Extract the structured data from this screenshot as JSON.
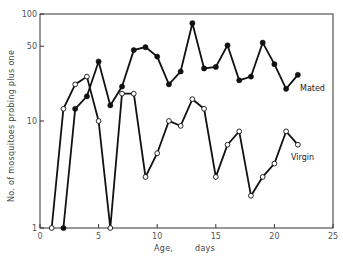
{
  "chart_data": {
    "type": "line",
    "title": "",
    "xlabel": "Age,        days",
    "ylabel": "No. of mosquitoes probing plus one",
    "xlim": [
      0,
      25
    ],
    "ylim": [
      1,
      100
    ],
    "yscale": "log",
    "xticks": [
      0,
      5,
      10,
      15,
      20,
      25
    ],
    "yticks": [
      1,
      10,
      50,
      100
    ],
    "ytick_labels": [
      "1",
      "10",
      "50",
      "100"
    ],
    "grid": false,
    "legend": "inline labels at line ends",
    "series": [
      {
        "name": "Mated",
        "marker": "filled-circle",
        "x": [
          2,
          3,
          4,
          5,
          6,
          7,
          8,
          9,
          10,
          11,
          12,
          13,
          14,
          15,
          16,
          17,
          18,
          19,
          20,
          21,
          22
        ],
        "values": [
          1,
          13,
          17,
          36,
          14,
          21,
          46,
          49,
          40,
          22,
          29,
          82,
          31,
          32,
          51,
          24,
          26,
          54,
          34,
          20,
          27
        ]
      },
      {
        "name": "Virgin",
        "marker": "open-circle",
        "x": [
          1,
          2,
          3,
          4,
          5,
          6,
          7,
          8,
          9,
          10,
          11,
          12,
          13,
          14,
          15,
          16,
          17,
          18,
          19,
          20,
          21,
          22
        ],
        "values": [
          1,
          13,
          22,
          26,
          10,
          1,
          18,
          18,
          3,
          5,
          10,
          9,
          16,
          13,
          3,
          6,
          8,
          2,
          3,
          4,
          8,
          6
        ]
      }
    ]
  },
  "labels": {
    "mated": "Mated",
    "virgin": "Virgin",
    "xlabel_age": "Age,",
    "xlabel_days": "days",
    "ylabel": "No. of mosquitoes probing plus one"
  }
}
